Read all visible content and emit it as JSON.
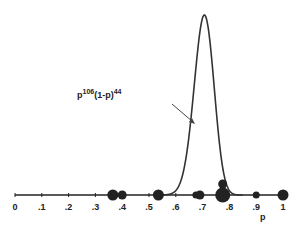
{
  "chart_data": {
    "type": "line",
    "title": "",
    "xlabel": "p",
    "ylabel": "",
    "xlim": [
      0,
      1
    ],
    "grid": false,
    "x_ticks": [
      "0",
      ".1",
      ".2",
      ".3",
      ".4",
      ".5",
      ".6",
      ".7",
      ".8",
      ".9",
      "1"
    ],
    "series": [
      {
        "name": "p^106(1-p)^44",
        "kind": "likelihood_curve",
        "peak_x": 0.707,
        "support": [
          0.56,
          0.82
        ]
      }
    ],
    "points": [
      {
        "x": 0.365,
        "size": "large"
      },
      {
        "x": 0.4,
        "size": "medium"
      },
      {
        "x": 0.535,
        "size": "large"
      },
      {
        "x": 0.675,
        "size": "small"
      },
      {
        "x": 0.69,
        "size": "medium"
      },
      {
        "x": 0.775,
        "size": "very-large"
      },
      {
        "x": 0.775,
        "size": "medium",
        "stacked": true
      },
      {
        "x": 0.9,
        "size": "small"
      },
      {
        "x": 1.0,
        "size": "large"
      }
    ],
    "annotation": {
      "base": "p",
      "exp1": "106",
      "mid": "(1-p)",
      "exp2": "44"
    }
  }
}
